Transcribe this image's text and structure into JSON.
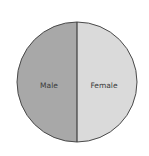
{
  "chart_data": {
    "type": "pie",
    "title": "",
    "categories": [
      "Male",
      "Female"
    ],
    "values": [
      50,
      50
    ],
    "colors": [
      "#a8a8a8",
      "#dadada"
    ],
    "legend": "none",
    "labels_inside": true,
    "start_angle_deg": 90,
    "direction": "counterclockwise-left-first"
  },
  "style": {
    "outline_color": "#4a4a4a",
    "divider_color": "#3c3c3c",
    "background": "#ffffff"
  }
}
